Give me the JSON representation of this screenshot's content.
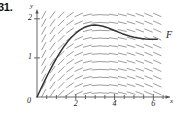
{
  "figure": {
    "problem_number": "31.",
    "curve_label": "F",
    "origin_label": "0",
    "x_axis_label": "x",
    "y_axis_label": "y",
    "line_color": "#333333",
    "field_color": "#8a8a8a",
    "axis_color": "#555555",
    "background": "#ffffff"
  },
  "chart_data": {
    "type": "line",
    "title": "",
    "xlabel": "x",
    "ylabel": "y",
    "xlim": [
      0,
      6.6
    ],
    "ylim": [
      0,
      2.2
    ],
    "grid": false,
    "legend": "none",
    "annotations": [
      {
        "text": "F",
        "x": 6.45,
        "y": 1.55
      }
    ],
    "xticks": [
      2,
      4,
      6
    ],
    "xtick_labels": [
      "2",
      "4",
      "6"
    ],
    "yticks": [
      1,
      2
    ],
    "ytick_labels": [
      "1",
      "2"
    ],
    "series": [
      {
        "name": "F",
        "x": [
          0,
          0.2,
          0.4,
          0.6,
          0.8,
          1.0,
          1.2,
          1.4,
          1.6,
          1.8,
          2.0,
          2.2,
          2.4,
          2.6,
          2.8,
          3.0,
          3.2,
          3.4,
          3.6,
          3.8,
          4.0,
          4.2,
          4.4,
          4.6,
          4.8,
          5.0,
          5.2,
          5.4,
          5.6,
          5.8,
          6.0,
          6.2
        ],
        "y": [
          0.0,
          0.21,
          0.42,
          0.62,
          0.81,
          0.99,
          1.15,
          1.3,
          1.43,
          1.54,
          1.63,
          1.71,
          1.77,
          1.81,
          1.835,
          1.84,
          1.83,
          1.81,
          1.78,
          1.74,
          1.7,
          1.66,
          1.62,
          1.585,
          1.555,
          1.53,
          1.51,
          1.495,
          1.485,
          1.48,
          1.477,
          1.476
        ]
      }
    ],
    "direction_field": {
      "description": "slope field of dy/dx decreasing with x, steep positive at left, near horizontal at right",
      "x_start": 0.35,
      "x_step": 0.45,
      "x_count": 14,
      "y_start": 0.1,
      "y_step": 0.2,
      "y_count": 11,
      "dash_length": 9
    }
  }
}
